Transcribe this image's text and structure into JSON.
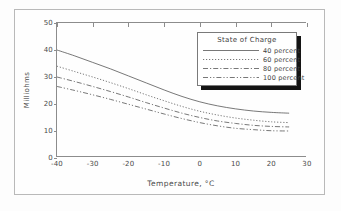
{
  "chart_data": {
    "type": "line",
    "title": "",
    "xlabel": "Temperature, °C",
    "ylabel": "Milliohms",
    "xlim": [
      -40,
      30
    ],
    "ylim": [
      0,
      50
    ],
    "xticks": [
      -40,
      -30,
      -20,
      -10,
      0,
      10,
      20,
      30
    ],
    "yticks": [
      0,
      10,
      20,
      30,
      40,
      50
    ],
    "grid": false,
    "legend_position": "upper right",
    "legend_title": "State of Charge",
    "x": [
      -40,
      -35,
      -30,
      -25,
      -20,
      -15,
      -10,
      -5,
      0,
      5,
      10,
      15,
      20,
      25
    ],
    "series": [
      {
        "name": "40 percent",
        "style": "solid",
        "values": [
          40.0,
          37.8,
          35.4,
          33.0,
          30.4,
          27.8,
          25.2,
          22.8,
          20.8,
          19.3,
          18.2,
          17.4,
          16.9,
          16.6
        ]
      },
      {
        "name": "60 percent",
        "style": "dotted",
        "values": [
          34.0,
          32.0,
          30.0,
          27.9,
          25.7,
          23.4,
          21.2,
          19.1,
          17.3,
          15.9,
          14.8,
          14.0,
          13.4,
          13.1
        ]
      },
      {
        "name": "80 percent",
        "style": "dash-dot",
        "values": [
          30.0,
          28.3,
          26.5,
          24.6,
          22.6,
          20.5,
          18.5,
          16.6,
          15.0,
          13.7,
          12.8,
          12.1,
          11.7,
          11.5
        ]
      },
      {
        "name": "100 percent",
        "style": "dash-dot-dot",
        "values": [
          26.5,
          25.0,
          23.4,
          21.7,
          19.9,
          18.1,
          16.3,
          14.6,
          13.1,
          11.9,
          11.0,
          10.5,
          10.1,
          10.0
        ]
      }
    ]
  },
  "legend": {
    "title": "State of Charge",
    "items": [
      {
        "label": "40 percent"
      },
      {
        "label": "60 percent"
      },
      {
        "label": "80 percent"
      },
      {
        "label": "100 percent"
      }
    ]
  },
  "axes": {
    "x_title": "Temperature, °C",
    "y_title": "Milliohms",
    "x_tick_labels": [
      "-40",
      "-30",
      "-20",
      "-10",
      "0",
      "10",
      "20",
      "30"
    ],
    "y_tick_labels": [
      "0",
      "10",
      "20",
      "30",
      "40",
      "50"
    ]
  },
  "colors": {
    "line": "#555555",
    "axis": "#8c8c8c",
    "frame": "#b9b9b9",
    "text": "#4a4a4a",
    "legend_shadow": "#141414",
    "background": "#fefefe"
  }
}
